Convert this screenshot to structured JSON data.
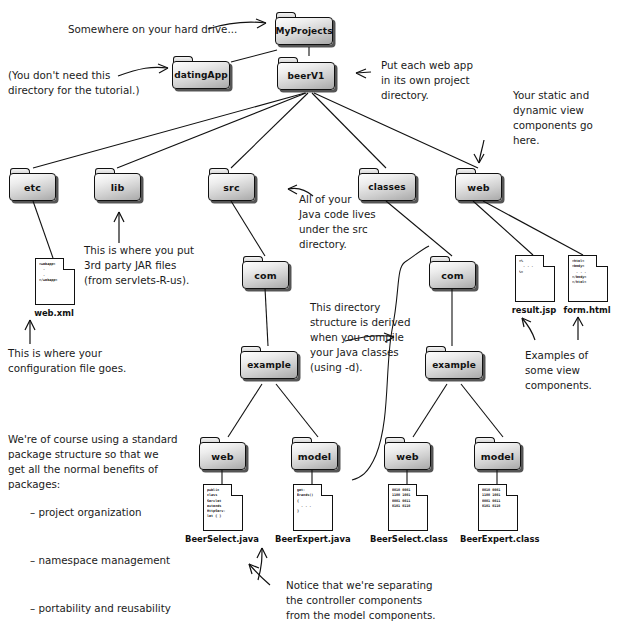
{
  "diagram": {
    "folders": [
      {
        "id": "myprojects",
        "label": "MyProjects"
      },
      {
        "id": "datingapp",
        "label": "datingApp"
      },
      {
        "id": "beerv1",
        "label": "beerV1"
      },
      {
        "id": "etc",
        "label": "etc"
      },
      {
        "id": "lib",
        "label": "lib"
      },
      {
        "id": "src",
        "label": "src"
      },
      {
        "id": "classes",
        "label": "classes"
      },
      {
        "id": "web-top",
        "label": "web"
      },
      {
        "id": "src-com",
        "label": "com"
      },
      {
        "id": "classes-com",
        "label": "com"
      },
      {
        "id": "src-example",
        "label": "example"
      },
      {
        "id": "classes-example",
        "label": "example"
      },
      {
        "id": "src-web",
        "label": "web"
      },
      {
        "id": "src-model",
        "label": "model"
      },
      {
        "id": "classes-web",
        "label": "web"
      },
      {
        "id": "classes-model",
        "label": "model"
      }
    ],
    "files": [
      {
        "id": "webxml",
        "name": "web.xml",
        "code": "<webapp>\n  .\n  .\n</webapp>"
      },
      {
        "id": "resultjsp",
        "name": "result.jsp",
        "code": "<%\n  . . .\n%>"
      },
      {
        "id": "formhtml",
        "name": "form.html",
        "code": "<html>\n<body>\n  . . .\n</body>\n</html>"
      },
      {
        "id": "beerselectjava",
        "name": "BeerSelect.java",
        "code": "public\nclass\nServlet\nextends\nHttpServ-\nlet { }"
      },
      {
        "id": "beerexpertjava",
        "name": "BeerExpert.java",
        "code": "get-\nBrands()\n{\n  . . .\n}"
      },
      {
        "id": "beerselectclass",
        "name": "BeerSelect.class",
        "code": "0010 0001\n1100 1001\n0001 0011\n0101 0110"
      },
      {
        "id": "beerexpertclass",
        "name": "BeerExpert.class",
        "code": "0010 0001\n1100 1001\n0001 0011\n0101 0110"
      }
    ],
    "notes": {
      "hard_drive": "Somewhere on your hard drive...",
      "dating_app": "(You don't need this\ndirectory for the tutorial.)",
      "per_project": "Put each web app\nin its own project\ndirectory.",
      "view_components_top": "Your static and\ndynamic view\ncomponents go here.",
      "jar_files": "This is where you put\n3rd party JAR files\n(from servlets-R-us).",
      "java_code": "All of your\nJava code lives\nunder the src\ndirectory.",
      "config_file": "This is where your\nconfiguration file goes.",
      "derived_structure": "This directory\nstructure is derived\nwhen you compile\nyour Java classes\n(using -d).",
      "view_examples": "Examples of\nsome view\ncomponents.",
      "package_structure": "We're of course using a standard\npackage structure so that we\nget all the normal benefits of\npackages:",
      "package_bullets": "– project organization\n\n– namespace management\n\n– portability and reusability",
      "separation": "Notice that we're separating\nthe controller components\nfrom the model components."
    }
  }
}
